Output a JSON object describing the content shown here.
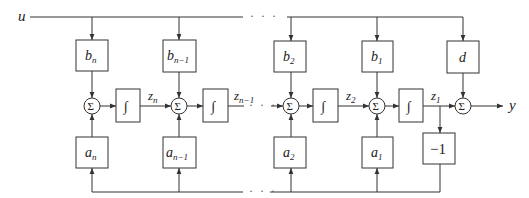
{
  "diagram": {
    "title": "",
    "input_label": "u",
    "output_label": "y",
    "ellipsis": "· · ·",
    "sum_symbol": "Σ",
    "integrator_symbol": "∫",
    "stages": [
      {
        "b": "b",
        "b_sub": "n",
        "a": "a",
        "a_sub": "n",
        "z": "z",
        "z_sub": "n"
      },
      {
        "b": "b",
        "b_sub": "n−1",
        "a": "a",
        "a_sub": "n−1",
        "z": "z",
        "z_sub": "n−1"
      },
      {
        "b": "b",
        "b_sub": "2",
        "a": "a",
        "a_sub": "2",
        "z": "z",
        "z_sub": "2"
      },
      {
        "b": "b",
        "b_sub": "1",
        "a": "a",
        "a_sub": "1",
        "z": "z",
        "z_sub": "1"
      }
    ],
    "feedthrough_label": "d",
    "feedback_gain_label": "−1",
    "colors": {
      "line": "#333333",
      "text": "#222222",
      "background": "#ffffff"
    }
  }
}
